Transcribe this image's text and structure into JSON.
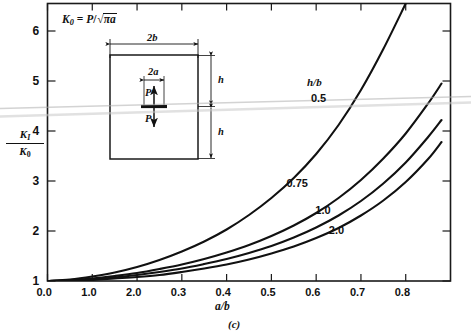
{
  "figure": {
    "caption": "(c)",
    "formula": {
      "lhs": "K",
      "lhs_sub": "0",
      "eq": " = ",
      "p": "P",
      "slash": "/",
      "radical": "√",
      "under": "πa"
    },
    "axis": {
      "x_title": "a/b",
      "y_title_num": "K",
      "y_title_num_sub": "I",
      "y_title_den": "K",
      "y_title_den_sub": "0",
      "x_ticks": [
        "0.0",
        "1.0",
        "2.0",
        "0.3",
        "0.4",
        "0.5",
        "0.6",
        "0.7",
        "0.8"
      ],
      "y_ticks": [
        "1",
        "2",
        "3",
        "4",
        "5",
        "6"
      ]
    },
    "legend": {
      "title": "h/b"
    },
    "inset": {
      "width_label": "2b",
      "crack_label": "2a",
      "height_label_top": "h",
      "height_label_bottom": "h",
      "load_label_top": "P",
      "load_label_bottom": "P"
    }
  },
  "chart_data": {
    "type": "line",
    "title": "",
    "xlabel": "a/b",
    "ylabel": "K_I/K_0",
    "xlim": [
      0.0,
      0.9
    ],
    "ylim": [
      1.0,
      6.55
    ],
    "grid": false,
    "legend_position": "inside-right",
    "legend_title": "h/b",
    "x_tick_values": [
      0.0,
      0.1,
      0.2,
      0.3,
      0.4,
      0.5,
      0.6,
      0.7,
      0.8
    ],
    "x_tick_labels_as_printed": [
      "0.0",
      "1.0",
      "2.0",
      "0.3",
      "0.4",
      "0.5",
      "0.6",
      "0.7",
      "0.8"
    ],
    "y_tick_values": [
      1,
      2,
      3,
      4,
      5,
      6
    ],
    "series": [
      {
        "name": "0.5",
        "label": "0.5",
        "x": [
          0.0,
          0.05,
          0.1,
          0.15,
          0.2,
          0.25,
          0.3,
          0.35,
          0.4,
          0.45,
          0.5,
          0.55,
          0.6,
          0.65,
          0.7,
          0.75,
          0.8
        ],
        "values": [
          1.0,
          1.03,
          1.09,
          1.17,
          1.28,
          1.42,
          1.59,
          1.79,
          2.03,
          2.32,
          2.66,
          3.06,
          3.54,
          4.12,
          4.82,
          5.64,
          6.55
        ]
      },
      {
        "name": "0.75",
        "label": "0.75",
        "x": [
          0.0,
          0.05,
          0.1,
          0.15,
          0.2,
          0.25,
          0.3,
          0.35,
          0.4,
          0.45,
          0.5,
          0.55,
          0.6,
          0.65,
          0.7,
          0.75,
          0.8,
          0.85,
          0.88
        ],
        "values": [
          1.0,
          1.02,
          1.05,
          1.1,
          1.16,
          1.24,
          1.33,
          1.44,
          1.57,
          1.72,
          1.9,
          2.11,
          2.36,
          2.66,
          3.02,
          3.45,
          3.95,
          4.55,
          4.95
        ]
      },
      {
        "name": "1.0",
        "label": "1.0",
        "x": [
          0.0,
          0.05,
          0.1,
          0.15,
          0.2,
          0.25,
          0.3,
          0.35,
          0.4,
          0.45,
          0.5,
          0.55,
          0.6,
          0.65,
          0.7,
          0.75,
          0.8,
          0.85,
          0.88
        ],
        "values": [
          1.0,
          1.01,
          1.04,
          1.07,
          1.12,
          1.18,
          1.25,
          1.34,
          1.44,
          1.56,
          1.7,
          1.87,
          2.07,
          2.31,
          2.6,
          2.95,
          3.37,
          3.88,
          4.22
        ]
      },
      {
        "name": "2.0",
        "label": "2.0",
        "x": [
          0.0,
          0.05,
          0.1,
          0.15,
          0.2,
          0.25,
          0.3,
          0.35,
          0.4,
          0.45,
          0.5,
          0.55,
          0.6,
          0.65,
          0.7,
          0.75,
          0.8,
          0.85,
          0.88
        ],
        "values": [
          1.0,
          1.01,
          1.02,
          1.05,
          1.08,
          1.12,
          1.18,
          1.25,
          1.33,
          1.43,
          1.55,
          1.69,
          1.86,
          2.06,
          2.31,
          2.61,
          2.98,
          3.44,
          3.78
        ]
      }
    ],
    "annotations": [
      {
        "text": "K_0 = P/sqrt(pi*a)",
        "x": 0.03,
        "y": 6.3
      },
      {
        "text": "h/b",
        "x": 0.6,
        "y": 5.25
      }
    ]
  },
  "colors": {
    "ink": "#111111",
    "frame": "#1a1a1a",
    "background": "#ffffff",
    "scan_artifact": "#b9b9b9"
  }
}
